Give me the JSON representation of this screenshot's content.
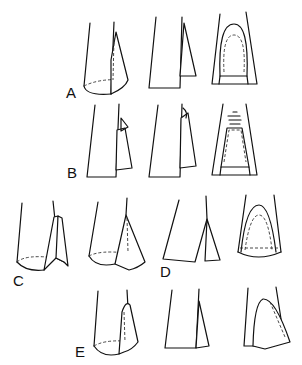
{
  "figure": {
    "rows": [
      {
        "label": "A",
        "panels": 3
      },
      {
        "label": "B",
        "panels": 3
      },
      {
        "label": "C",
        "panels": 2
      },
      {
        "label": "D",
        "panels": 2
      },
      {
        "label": "E",
        "panels": 3
      }
    ],
    "labels": {
      "a": "A",
      "b": "B",
      "c": "C",
      "d": "D",
      "e": "E"
    }
  }
}
